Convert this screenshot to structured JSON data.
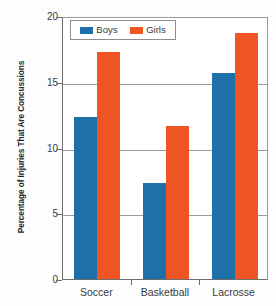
{
  "chart_data": {
    "type": "bar",
    "title": "",
    "subtitle": "",
    "xlabel": "",
    "ylabel": "Percentage of Injuries That Are Concussions",
    "categories": [
      "Soccer",
      "Basketball",
      "Lacrosse"
    ],
    "series": [
      {
        "name": "Boys",
        "color": "#1f6fa8",
        "values": [
          12.3,
          7.3,
          15.7
        ]
      },
      {
        "name": "Girls",
        "color": "#ee5522",
        "values": [
          17.3,
          11.6,
          18.7
        ]
      }
    ],
    "ylim": [
      0,
      20
    ],
    "ytick_labels": [
      "0",
      "5",
      "10",
      "15",
      "20"
    ],
    "ytick_values": [
      0,
      5,
      10,
      15,
      20
    ],
    "grid": "horizontal",
    "legend_position": "top-left-inside",
    "annotations": []
  },
  "legend": {
    "entries": [
      {
        "label": "Boys",
        "swatch": "boys-color-swatch"
      },
      {
        "label": "Girls",
        "swatch": "girls-color-swatch"
      }
    ]
  },
  "colors": {
    "boys": "#1f6fa8",
    "girls": "#ee5522",
    "axis": "#6e6e6e",
    "gridline": "#9d9d9d",
    "text": "#3a3a3a",
    "background": "#ffffff"
  }
}
